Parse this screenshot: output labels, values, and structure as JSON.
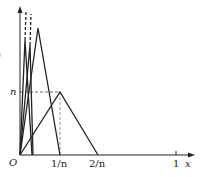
{
  "diagram": {
    "type": "function-sequence-plot",
    "colors": {
      "stroke": "#222222",
      "dashed": "#555555",
      "background": "#ffffff"
    },
    "axes": {
      "x_label": "x",
      "origin_label": "O",
      "x_ticks": [
        {
          "label": "1/n",
          "x": 60
        },
        {
          "label": "2/n",
          "x": 98
        },
        {
          "label": "1",
          "x": 176
        }
      ],
      "y_ticks": [
        {
          "label": "n",
          "y": 92
        }
      ]
    },
    "left_cropped_glyph": ")",
    "triangles": [
      {
        "name": "f_n",
        "base_start": [
          20,
          155
        ],
        "peak": [
          60,
          92
        ],
        "base_end": [
          98,
          155
        ]
      },
      {
        "name": "f_2n",
        "base_start": [
          20,
          155
        ],
        "peak": [
          38,
          28
        ],
        "base_end": [
          60,
          155
        ]
      },
      {
        "name": "f_large_1",
        "base_start": [
          20,
          155
        ],
        "peak": [
          26,
          12
        ],
        "base_end": [
          32,
          155
        ],
        "dashed_top": true
      },
      {
        "name": "f_large_2",
        "base_start": [
          20,
          155
        ],
        "peak": [
          31,
          14
        ],
        "base_end": [
          42,
          155
        ],
        "dashed_top": true
      }
    ]
  }
}
